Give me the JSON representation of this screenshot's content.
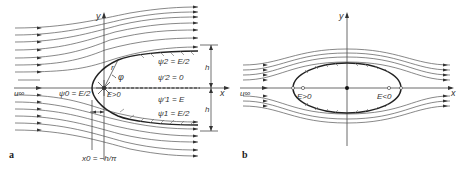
{
  "figure": {
    "panels": [
      {
        "id": "a",
        "label": "a",
        "description": "Rankine half-body: source in uniform flow",
        "axes": {
          "x_label": "x",
          "y_label": "y"
        },
        "freestream_label": "u∞",
        "labels": {
          "psi0": "ψ0 = E/2",
          "psi2_upper": "ψ2 = E/2",
          "psi2_zero": "ψ'2 = 0",
          "psi1_E": "ψ'1 = E",
          "psi1_lower": "ψ1 = E/2",
          "source": "E>0",
          "r": "r",
          "phi": "φ",
          "h_upper": "h",
          "h_lower": "h",
          "x0": "x0 = −h/π"
        }
      },
      {
        "id": "b",
        "label": "b",
        "description": "Rankine oval: source and sink in uniform flow",
        "axes": {
          "x_label": "x",
          "y_label": "y"
        },
        "freestream_label": "u∞",
        "labels": {
          "source": "E>0",
          "sink": "E<0"
        }
      }
    ]
  }
}
